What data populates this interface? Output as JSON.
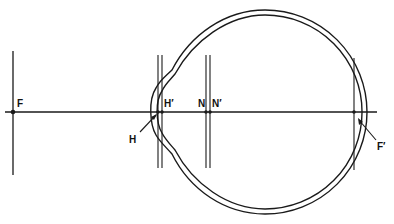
{
  "diagram": {
    "stroke_color": "#1a1a1a",
    "background": "#ffffff",
    "labels": {
      "F": "F",
      "H": "H",
      "H_prime": "H′",
      "N": "N",
      "N_prime": "N′",
      "F_prime": "F′"
    },
    "points": [
      {
        "name": "F",
        "description": "anterior focal point"
      },
      {
        "name": "H",
        "description": "first principal point"
      },
      {
        "name": "H′",
        "description": "second principal point"
      },
      {
        "name": "N",
        "description": "first nodal point"
      },
      {
        "name": "N′",
        "description": "second nodal point"
      },
      {
        "name": "F′",
        "description": "posterior focal point"
      }
    ]
  }
}
